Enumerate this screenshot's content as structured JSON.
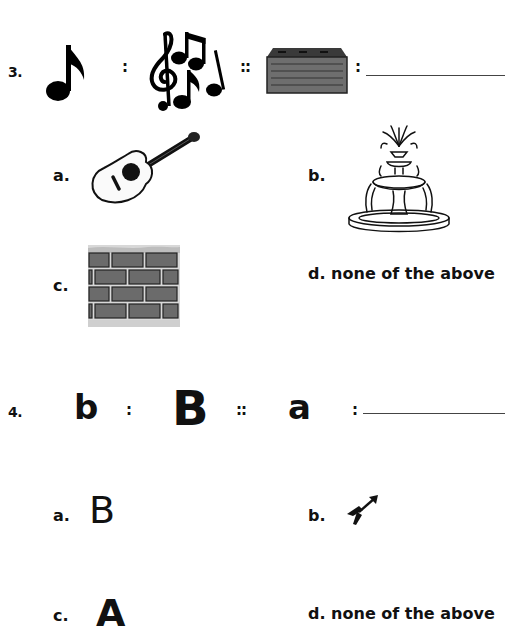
{
  "questions": [
    {
      "number": "3.",
      "analogy": {
        "term1": "eighth-note-icon",
        "separator1": ":",
        "term2": "music-notes-with-treble-clef-icon",
        "separator2": "::",
        "term3": "brick-icon",
        "separator3": ":",
        "term4_blank": ""
      },
      "options": [
        {
          "label": "a.",
          "content": "guitar-icon"
        },
        {
          "label": "b.",
          "content": "fountain-icon"
        },
        {
          "label": "c.",
          "content": "brick-wall-icon"
        },
        {
          "label": "d.",
          "text": "none of the above"
        }
      ]
    },
    {
      "number": "4.",
      "analogy": {
        "term1": "b",
        "separator1": ":",
        "term2": "B",
        "separator2": "::",
        "term3": "a",
        "separator3": ":",
        "term4_blank": ""
      },
      "options": [
        {
          "label": "a.",
          "text": "B"
        },
        {
          "label": "b.",
          "content": "arrow-icon"
        },
        {
          "label": "c.",
          "text": "A"
        },
        {
          "label": "d.",
          "text": "none of the above"
        }
      ]
    }
  ]
}
